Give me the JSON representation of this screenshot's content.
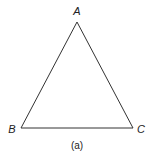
{
  "figure": {
    "caption": "(a)",
    "stroke_color": "#333333",
    "vertices": [
      {
        "label": "A",
        "x": 77,
        "y": 22,
        "label_x": 77,
        "label_y": 15
      },
      {
        "label": "B",
        "x": 21,
        "y": 128,
        "label_x": 12,
        "label_y": 133
      },
      {
        "label": "C",
        "x": 133,
        "y": 128,
        "label_x": 141,
        "label_y": 133
      }
    ],
    "shape": "triangle"
  }
}
